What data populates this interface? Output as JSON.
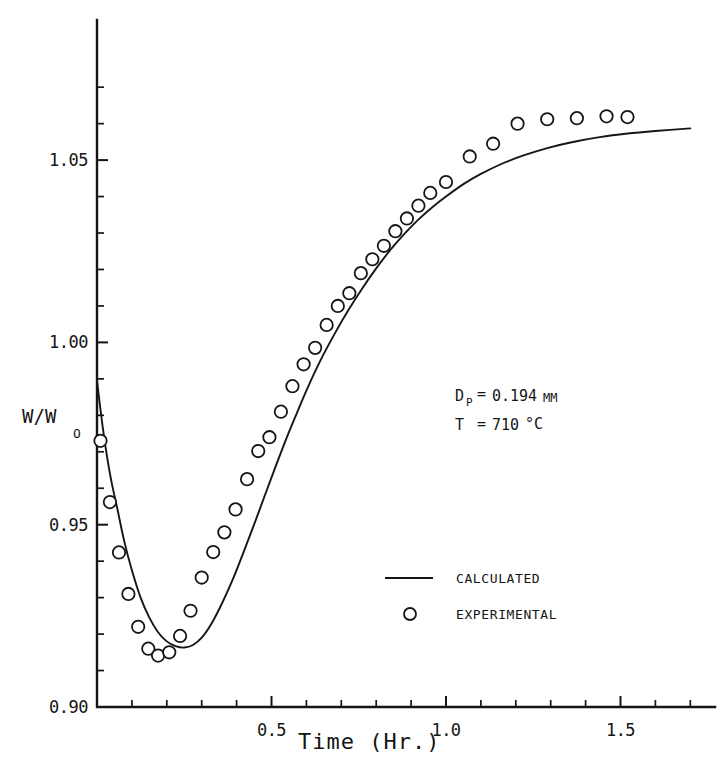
{
  "chart_data": {
    "type": "scatter",
    "title": "",
    "xlabel": "Time (Hr.)",
    "ylabel": "W/W",
    "ylabel_subscript": "O",
    "xlim": [
      0,
      1.72
    ],
    "ylim": [
      0.9,
      1.073
    ],
    "grid": false,
    "x_ticks_major": [
      0.5,
      1.0,
      1.5
    ],
    "x_tick_labels": [
      "0.5",
      "1.0",
      "1.5"
    ],
    "x_ticks_minor": [
      0.1,
      0.2,
      0.3,
      0.4,
      0.6,
      0.7,
      0.8,
      0.9,
      1.1,
      1.2,
      1.3,
      1.4,
      1.6,
      1.7
    ],
    "y_ticks_major": [
      0.9,
      0.95,
      1.0,
      1.05
    ],
    "y_tick_labels": [
      "0.90",
      "0.95",
      "1.00",
      "1.05"
    ],
    "y_ticks_minor": [
      0.91,
      0.92,
      0.93,
      0.94,
      0.96,
      0.97,
      0.98,
      0.99,
      1.01,
      1.02,
      1.03,
      1.04,
      1.06,
      1.07
    ],
    "legend_position": "lower-center-right",
    "series": [
      {
        "name": "CALCULATED",
        "type": "line",
        "x": [
          0.0,
          0.012,
          0.025,
          0.04,
          0.058,
          0.078,
          0.1,
          0.125,
          0.15,
          0.175,
          0.2,
          0.225,
          0.25,
          0.275,
          0.3,
          0.33,
          0.36,
          0.39,
          0.42,
          0.45,
          0.48,
          0.51,
          0.54,
          0.57,
          0.6,
          0.64,
          0.68,
          0.72,
          0.76,
          0.8,
          0.84,
          0.88,
          0.92,
          0.96,
          1.0,
          1.05,
          1.1,
          1.16,
          1.22,
          1.29,
          1.36,
          1.44,
          1.52,
          1.6,
          1.7
        ],
        "y": [
          0.9895,
          0.98,
          0.971,
          0.9625,
          0.9545,
          0.9455,
          0.9375,
          0.93,
          0.9245,
          0.9205,
          0.918,
          0.9167,
          0.9163,
          0.917,
          0.919,
          0.9232,
          0.9288,
          0.9352,
          0.9425,
          0.95,
          0.9578,
          0.9655,
          0.973,
          0.98,
          0.9868,
          0.995,
          1.0022,
          1.0088,
          1.0148,
          1.0203,
          1.0253,
          1.0297,
          1.0336,
          1.037,
          1.04,
          1.0434,
          1.0462,
          1.049,
          1.0512,
          1.0533,
          1.0549,
          1.0563,
          1.0573,
          1.058,
          1.0587
        ]
      },
      {
        "name": "EXPERIMENTAL",
        "type": "scatter",
        "marker": "open-circle",
        "x": [
          0.01,
          0.037,
          0.063,
          0.09,
          0.118,
          0.147,
          0.175,
          0.207,
          0.238,
          0.268,
          0.3,
          0.333,
          0.365,
          0.397,
          0.43,
          0.462,
          0.494,
          0.527,
          0.56,
          0.592,
          0.625,
          0.658,
          0.69,
          0.723,
          0.756,
          0.789,
          0.822,
          0.855,
          0.888,
          0.921,
          0.955,
          1.0,
          1.068,
          1.135,
          1.205,
          1.29,
          1.375,
          1.46,
          1.52
        ],
        "y": [
          0.973,
          0.9562,
          0.9424,
          0.931,
          0.922,
          0.916,
          0.9141,
          0.915,
          0.9195,
          0.9264,
          0.9355,
          0.9425,
          0.9479,
          0.9542,
          0.9625,
          0.9702,
          0.974,
          0.981,
          0.988,
          0.994,
          0.9985,
          1.0048,
          1.01,
          1.0135,
          1.019,
          1.0228,
          1.0265,
          1.0305,
          1.034,
          1.0375,
          1.041,
          1.044,
          1.051,
          1.0545,
          1.06,
          1.0612,
          1.0615,
          1.062,
          1.0618
        ]
      }
    ],
    "annotations": [
      {
        "id": "particle-diameter",
        "label": "D",
        "sub": "P",
        "equals": "=",
        "value": "0.194",
        "unit": "MM"
      },
      {
        "id": "temperature",
        "label": "T",
        "sub": "",
        "equals": "=",
        "value": "710",
        "unit": "°C"
      }
    ]
  },
  "legend": {
    "items": [
      {
        "marker": "line",
        "label": "CALCULATED"
      },
      {
        "marker": "open-circle",
        "label": "EXPERIMENTAL"
      }
    ]
  }
}
